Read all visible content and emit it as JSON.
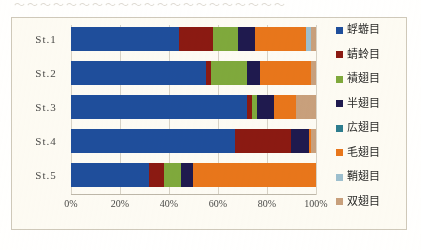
{
  "scan_artifact": {
    "top_line": "〜〜〜〜〜〜〜〜〜〜〜〜〜〜〜〜〜〜〜〜〜"
  },
  "axis": {
    "x_ticks": [
      "0%",
      "20%",
      "40%",
      "60%",
      "80%",
      "100%"
    ],
    "x_tick_values": [
      0,
      20,
      40,
      60,
      80,
      100
    ],
    "y_categories": [
      "St.1",
      "St.2",
      "St.3",
      "St.4",
      "St.5"
    ]
  },
  "legend": {
    "items": [
      {
        "label": "蜉蝣目",
        "color": "#1F4E9C"
      },
      {
        "label": "蜻蛉目",
        "color": "#8B1A12"
      },
      {
        "label": "襀翅目",
        "color": "#7FA93C"
      },
      {
        "label": "半翅目",
        "color": "#1F1A4E"
      },
      {
        "label": "広翅目",
        "color": "#2E7D8F"
      },
      {
        "label": "毛翅目",
        "color": "#E8761B"
      },
      {
        "label": "鞘翅目",
        "color": "#9DBFCF"
      },
      {
        "label": "双翅目",
        "color": "#C8A07C"
      }
    ]
  },
  "chart_data": {
    "type": "bar",
    "orientation": "horizontal",
    "stacked": true,
    "normalized_percent": true,
    "title": "",
    "xlabel": "",
    "ylabel": "",
    "xlim": [
      0,
      100
    ],
    "grid": true,
    "legend_position": "right",
    "categories": [
      "St.1",
      "St.2",
      "St.3",
      "St.4",
      "St.5"
    ],
    "series": [
      {
        "name": "蜉蝣目",
        "color": "#1F4E9C",
        "values": [
          44,
          55,
          72,
          67,
          32
        ]
      },
      {
        "name": "蜻蛉目",
        "color": "#8B1A12",
        "values": [
          14,
          2,
          2,
          23,
          6
        ]
      },
      {
        "name": "襀翅目",
        "color": "#7FA93C",
        "values": [
          10,
          15,
          2,
          0,
          7
        ]
      },
      {
        "name": "半翅目",
        "color": "#1F1A4E",
        "values": [
          7,
          5,
          7,
          7,
          5
        ]
      },
      {
        "name": "広翅目",
        "color": "#2E7D8F",
        "values": [
          0,
          0,
          0,
          0,
          0
        ]
      },
      {
        "name": "毛翅目",
        "color": "#E8761B",
        "values": [
          21,
          21,
          9,
          1,
          50
        ]
      },
      {
        "name": "鞘翅目",
        "color": "#9DBFCF",
        "values": [
          2,
          0,
          0,
          0,
          0
        ]
      },
      {
        "name": "双翅目",
        "color": "#C8A07C",
        "values": [
          2,
          2,
          8,
          2,
          0
        ]
      }
    ]
  }
}
